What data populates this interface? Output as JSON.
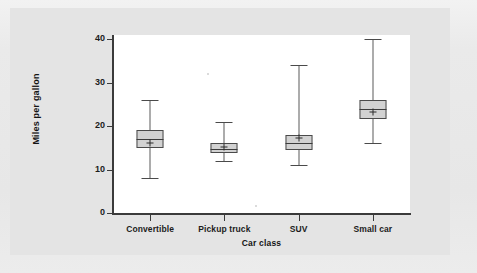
{
  "chart_data": {
    "type": "box",
    "title": "",
    "xlabel": "Car class",
    "ylabel": "Miles per gallon",
    "categories": [
      "Convertible",
      "Pickup truck",
      "SUV",
      "Small car"
    ],
    "ylim": [
      0,
      42
    ],
    "yticks": [
      0,
      10,
      20,
      30,
      40
    ],
    "ytick_labels": [
      "0",
      "10",
      "20",
      "30",
      "40"
    ],
    "grid": false,
    "legend": null,
    "mean_marker": "+",
    "boxes": [
      {
        "category": "Convertible",
        "min": 8.0,
        "q1": 15.0,
        "median": 17.0,
        "mean": 16.2,
        "q3": 19.0,
        "max": 26.0
      },
      {
        "category": "Pickup truck",
        "min": 12.0,
        "q1": 13.8,
        "median": 14.7,
        "mean": 15.2,
        "q3": 16.0,
        "max": 21.0
      },
      {
        "category": "SUV",
        "min": 11.0,
        "q1": 14.5,
        "median": 16.0,
        "mean": 17.2,
        "q3": 18.0,
        "max": 34.0
      },
      {
        "category": "Small car",
        "min": 16.0,
        "q1": 21.5,
        "median": 24.0,
        "mean": 23.2,
        "q3": 26.0,
        "max": 40.0
      }
    ],
    "colors": {
      "box_fill": "#d2d2d2",
      "box_edge": "#4a4a4a",
      "axis": "#3b3b3b",
      "plot_background": "#ffffff",
      "panel_background": "#e4e4e4",
      "page_background": "#e9e9e9",
      "text": "#1c1c1c"
    }
  }
}
